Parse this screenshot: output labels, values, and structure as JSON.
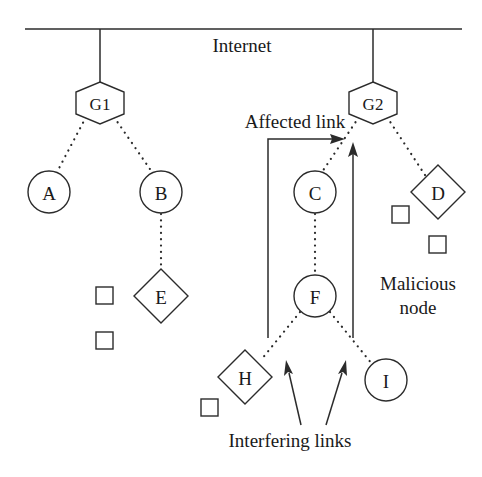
{
  "figure": {
    "backbone_label": "Internet",
    "colors": {
      "stroke": "#2b2b2b",
      "fill": "#ffffff",
      "text": "#1a1a1a",
      "background": "#ffffff"
    }
  },
  "gateways": [
    {
      "id": "G1",
      "label": "G1",
      "shape": "hexagon",
      "cx": 100,
      "cy": 103
    },
    {
      "id": "G2",
      "label": "G2",
      "shape": "hexagon",
      "cx": 373,
      "cy": 103
    }
  ],
  "nodes": [
    {
      "id": "A",
      "label": "A",
      "shape": "circle",
      "cx": 49,
      "cy": 192,
      "r": 21
    },
    {
      "id": "B",
      "label": "B",
      "shape": "circle",
      "cx": 161,
      "cy": 192,
      "r": 21
    },
    {
      "id": "C",
      "label": "C",
      "shape": "circle",
      "cx": 315,
      "cy": 192,
      "r": 21
    },
    {
      "id": "D",
      "label": "D",
      "shape": "diamond",
      "cx": 438,
      "cy": 192,
      "r": 27
    },
    {
      "id": "E",
      "label": "E",
      "shape": "diamond",
      "cx": 161,
      "cy": 296,
      "r": 27
    },
    {
      "id": "F",
      "label": "F",
      "shape": "circle",
      "cx": 315,
      "cy": 296,
      "r": 21
    },
    {
      "id": "H",
      "label": "H",
      "shape": "diamond",
      "cx": 245,
      "cy": 377,
      "r": 27
    },
    {
      "id": "I",
      "label": "I",
      "shape": "circle",
      "cx": 386,
      "cy": 380,
      "r": 21
    }
  ],
  "obstacles": [
    {
      "id": "sq1",
      "x": 104,
      "y": 295,
      "size": 17
    },
    {
      "id": "sq2",
      "x": 104,
      "y": 340,
      "size": 17
    },
    {
      "id": "sq3",
      "x": 400,
      "y": 214,
      "size": 17
    },
    {
      "id": "sq4",
      "x": 437,
      "y": 244,
      "size": 17
    },
    {
      "id": "sq5",
      "x": 209,
      "y": 407,
      "size": 17
    }
  ],
  "links": [
    {
      "from": "G1",
      "to": "A",
      "style": "dotted"
    },
    {
      "from": "G1",
      "to": "B",
      "style": "dotted"
    },
    {
      "from": "B",
      "to": "E",
      "style": "dotted"
    },
    {
      "from": "G2",
      "to": "C",
      "style": "dotted"
    },
    {
      "from": "G2",
      "to": "D",
      "style": "dotted"
    },
    {
      "from": "C",
      "to": "F",
      "style": "dotted"
    },
    {
      "from": "F",
      "to": "H",
      "style": "dotted"
    },
    {
      "from": "F",
      "to": "I",
      "style": "dotted"
    }
  ],
  "annotations": {
    "affected_link": {
      "label": "Affected link",
      "x": 295,
      "y": 128,
      "arrow": "elbow-right"
    },
    "malicious_node": {
      "label_line1": "Malicious",
      "label_line2": "node",
      "x": 418,
      "y1": 290,
      "y2": 314,
      "arrow": "up"
    },
    "interfering_links": {
      "label": "Interfering links",
      "x": 290,
      "y": 447,
      "arrow": "double-up"
    }
  }
}
